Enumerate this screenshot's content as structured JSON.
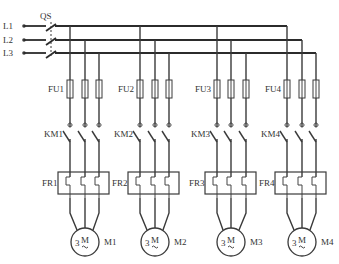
{
  "diagram": {
    "supply": {
      "lines": [
        {
          "label": "L1",
          "y": 26
        },
        {
          "label": "L2",
          "y": 40
        },
        {
          "label": "L3",
          "y": 53
        }
      ],
      "switch_label": "QS",
      "bus_ends_x": [
        287,
        302,
        316
      ]
    },
    "branches": [
      {
        "fuse": "FU1",
        "contactor": "KM1",
        "relay": "FR1",
        "motor": "M1",
        "motor_symbol": "M",
        "phases": "3",
        "x": [
          70,
          85,
          99
        ]
      },
      {
        "fuse": "FU2",
        "contactor": "KM2",
        "relay": "FR2",
        "motor": "M2",
        "motor_symbol": "M",
        "phases": "3",
        "x": [
          140,
          155,
          169
        ]
      },
      {
        "fuse": "FU3",
        "contactor": "KM3",
        "relay": "FR3",
        "motor": "M3",
        "motor_symbol": "M",
        "phases": "3",
        "x": [
          217,
          231,
          246
        ]
      },
      {
        "fuse": "FU4",
        "contactor": "KM4",
        "relay": "FR4",
        "motor": "M4",
        "motor_symbol": "M",
        "phases": "3",
        "x": [
          287,
          302,
          316
        ]
      }
    ],
    "colors": {
      "line": "#3a3a3a",
      "text": "#333333",
      "background": "#ffffff"
    }
  }
}
